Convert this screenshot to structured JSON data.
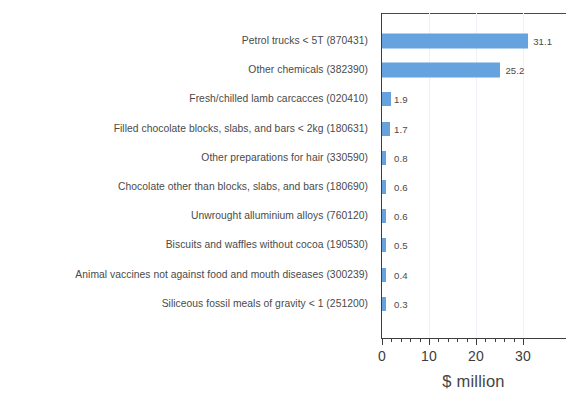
{
  "chart_data": {
    "type": "bar",
    "orientation": "horizontal",
    "title": "",
    "subtitle": "",
    "xlabel": "$ million",
    "ylabel": "",
    "xlim": [
      0,
      36
    ],
    "xticks": [
      0,
      10,
      20,
      30
    ],
    "xtick_labels": [
      "0",
      "10",
      "20",
      "30"
    ],
    "minor_tick_step": 2,
    "grid": "vertical-faint",
    "legend": "none",
    "bar_color": "#66a2dd",
    "categories": [
      "Petrol trucks < 5T (870431)",
      "Other chemicals (382390)",
      "Fresh/chilled lamb carcacces (020410)",
      "Filled chocolate blocks, slabs, and bars < 2kg (180631)",
      "Other preparations for hair (330590)",
      "Chocolate other than blocks, slabs, and bars (180690)",
      "Unwrought alluminium alloys (760120)",
      "Biscuits and waffles without cocoa (190530)",
      "Animal vaccines not against food and mouth diseases (300239)",
      "Siliceous fossil meals of gravity < 1 (251200)"
    ],
    "values": [
      31.1,
      25.2,
      1.9,
      1.7,
      0.8,
      0.6,
      0.6,
      0.5,
      0.4,
      0.3
    ],
    "value_labels": [
      "31.1",
      "25.2",
      "1.9",
      "1.7",
      "0.8",
      "0.6",
      "0.6",
      "0.5",
      "0.4",
      "0.3"
    ]
  },
  "axis": {
    "unit_label": "$ million"
  }
}
